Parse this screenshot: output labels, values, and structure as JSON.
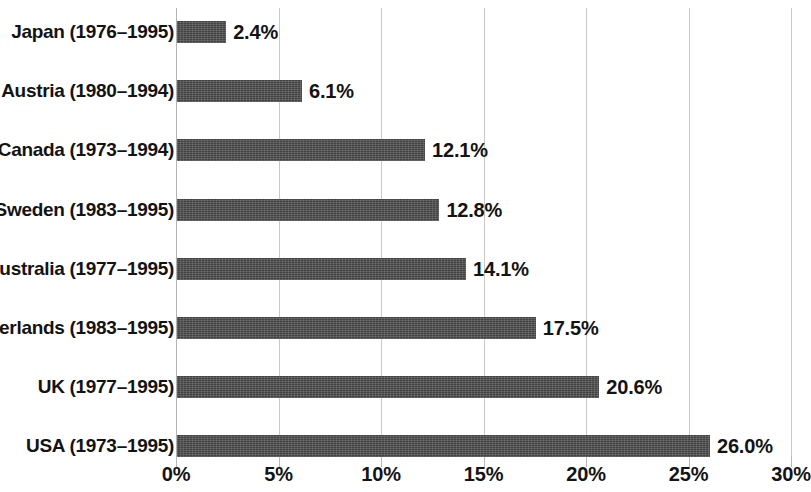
{
  "chart_data": {
    "type": "bar",
    "orientation": "horizontal",
    "title": "",
    "subtitle": "",
    "xlabel": "",
    "ylabel": "",
    "xlim": [
      0,
      30
    ],
    "xtick_labels": [
      "0%",
      "5%",
      "10%",
      "15%",
      "20%",
      "25%",
      "30%"
    ],
    "xticks": [
      0,
      5,
      10,
      15,
      20,
      25,
      30
    ],
    "grid": true,
    "legend": null,
    "value_suffix": "%",
    "bar_color": "#4c4c4c",
    "gridline_color": "#c9c9c9",
    "text_color": "#131313",
    "background_color": "#ffffff",
    "categories": [
      "Japan (1976–1995)",
      "Austria (1980–1994)",
      "Canada (1973–1994)",
      "Sweden (1983–1995)",
      "Australia (1977–1995)",
      "Netherlands (1983–1995)",
      "UK (1977–1995)",
      "USA (1973–1995)"
    ],
    "values": [
      2.4,
      6.1,
      12.1,
      12.8,
      14.1,
      17.5,
      20.6,
      26.0
    ],
    "value_labels": [
      "2.4%",
      "6.1%",
      "12.1%",
      "12.8%",
      "14.1%",
      "17.5%",
      "20.6%",
      "26.0%"
    ],
    "bars": [
      {
        "category": "Japan (1976–1995)",
        "value": 2.4,
        "label": "2.4%"
      },
      {
        "category": "Austria (1980–1994)",
        "value": 6.1,
        "label": "6.1%"
      },
      {
        "category": "Canada (1973–1994)",
        "value": 12.1,
        "label": "12.1%"
      },
      {
        "category": "Sweden (1983–1995)",
        "value": 12.8,
        "label": "12.8%"
      },
      {
        "category": "Australia (1977–1995)",
        "value": 14.1,
        "label": "14.1%"
      },
      {
        "category": "Netherlands (1983–1995)",
        "value": 17.5,
        "label": "17.5%"
      },
      {
        "category": "UK (1977–1995)",
        "value": 20.6,
        "label": "20.6%"
      },
      {
        "category": "USA (1973–1995)",
        "value": 26.0,
        "label": "26.0%"
      }
    ]
  },
  "layout": {
    "axis_origin_x": 176,
    "axis_end_x": 791,
    "px_per_percent": 20.5,
    "plot_top": 8,
    "plot_height": 448,
    "row_pitch": 59.2,
    "first_row_top": 20,
    "bar_thickness": 22
  }
}
